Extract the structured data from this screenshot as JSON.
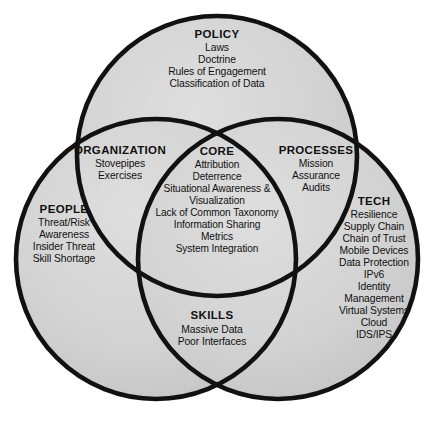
{
  "diagram": {
    "type": "venn-3-circle",
    "background_color": "#ffffff",
    "fill_color": "#d2d2d2",
    "stroke_color": "#111111",
    "text_color": "#111111"
  },
  "regions": {
    "policy": {
      "heading": "POLICY",
      "items": [
        "Laws",
        "Doctrine",
        "Rules of Engagement",
        "Classification of Data"
      ]
    },
    "organization": {
      "heading": "ORGANIZATION",
      "items": [
        "Stovepipes",
        "Exercises"
      ]
    },
    "processes": {
      "heading": "PROCESSES",
      "items": [
        "Mission",
        "Assurance",
        "Audits"
      ]
    },
    "core": {
      "heading": "CORE",
      "items": [
        "Attribution",
        "Deterrence",
        "Situational Awareness &",
        "Visualization",
        "Lack of Common Taxonomy",
        "Information Sharing",
        "Metrics",
        "System Integration"
      ]
    },
    "people": {
      "heading": "PEOPLE",
      "items": [
        "Threat/Risk",
        "Awareness",
        "Insider Threat",
        "Skill Shortage"
      ]
    },
    "tech": {
      "heading": "TECH",
      "items": [
        "Resilience",
        "Supply Chain",
        "Chain of Trust",
        "Mobile Devices",
        "Data Protection",
        "IPv6",
        "Identity",
        "Management",
        "Virtual Systems",
        "Cloud",
        "IDS/IPS"
      ]
    },
    "skills": {
      "heading": "SKILLS",
      "items": [
        "Massive Data",
        "Poor Interfaces"
      ]
    }
  }
}
